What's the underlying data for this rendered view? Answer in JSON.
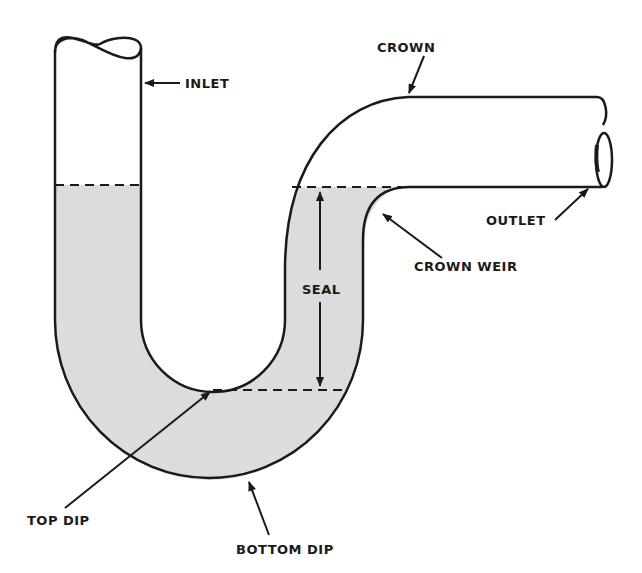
{
  "diagram": {
    "colors": {
      "line": "#1a1a1a",
      "water": "#dcdcdc",
      "background": "#ffffff"
    },
    "labels": {
      "inlet": "INLET",
      "crown": "CROWN",
      "outlet": "OUTLET",
      "crown_weir": "CROWN WEIR",
      "seal": "SEAL",
      "top_dip": "TOP DIP",
      "bottom_dip": "BOTTOM DIP"
    }
  }
}
